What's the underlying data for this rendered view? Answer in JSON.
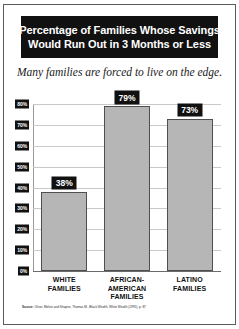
{
  "title": {
    "line1": "Percentage of Families Whose Savings",
    "line2": "Would Run Out in 3 Months or Less"
  },
  "subtitle": "Many families are forced to live on the edge.",
  "source": {
    "label": "Source:",
    "text": "Oliver, Melvin and Shapiro, Thomas M., Black Wealth, White Wealth (1995), p. 87"
  },
  "colors": {
    "bar_fill": "#b6b6b6",
    "bar_border": "#4f4f4f",
    "banner_bg": "#111111",
    "banner_text": "#ffffff",
    "gridline": "#c9c9c9"
  },
  "chart_data": {
    "type": "bar",
    "title": "Percentage of Families Whose Savings Would Run Out in 3 Months or Less",
    "subtitle": "Many families are forced to live on the edge.",
    "xlabel": "",
    "ylabel": "",
    "categories": [
      "WHITE FAMILIES",
      "AFRICAN-AMERICAN FAMILIES",
      "LATINO FAMILIES"
    ],
    "category_lines": [
      [
        "WHITE",
        "FAMILIES"
      ],
      [
        "AFRICAN-",
        "AMERICAN",
        "FAMILIES"
      ],
      [
        "LATINO",
        "FAMILIES"
      ]
    ],
    "values": [
      38,
      79,
      73
    ],
    "value_labels": [
      "38%",
      "79%",
      "73%"
    ],
    "ylim": [
      0,
      80
    ],
    "yticks": [
      0,
      10,
      20,
      30,
      40,
      50,
      60,
      70,
      80
    ],
    "ytick_labels": [
      "0%",
      "10%",
      "20%",
      "30%",
      "40%",
      "50%",
      "60%",
      "70%",
      "80%"
    ],
    "grid": true,
    "legend": false
  }
}
